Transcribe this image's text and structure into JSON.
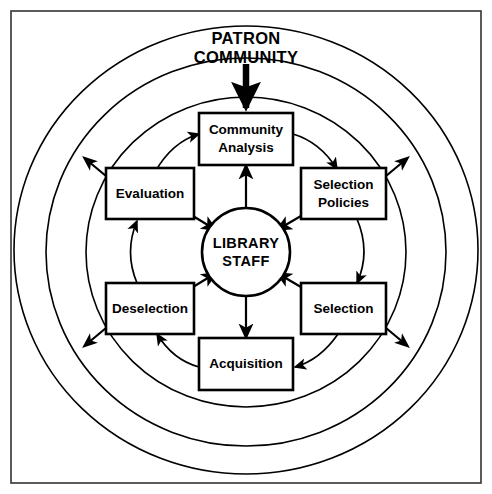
{
  "diagram": {
    "external_source": {
      "line1": "PATRON",
      "line2": "COMMUNITY"
    },
    "core": {
      "line1": "LIBRARY",
      "line2": "STAFF"
    },
    "nodes": [
      {
        "id": "community-analysis",
        "line1": "Community",
        "line2": "Analysis",
        "position": "top"
      },
      {
        "id": "selection-policies",
        "line1": "Selection",
        "line2": "Policies",
        "position": "top-right"
      },
      {
        "id": "selection",
        "line1": "Selection",
        "line2": "",
        "position": "bottom-right"
      },
      {
        "id": "acquisition",
        "line1": "Acquisition",
        "line2": "",
        "position": "bottom"
      },
      {
        "id": "deselection",
        "line1": "Deselection",
        "line2": "",
        "position": "bottom-left"
      },
      {
        "id": "evaluation",
        "line1": "Evaluation",
        "line2": "",
        "position": "top-left"
      }
    ],
    "colors": {
      "stroke": "#000000",
      "background": "#ffffff",
      "frame": "#333333"
    },
    "rings": [
      {
        "name": "outer-ring"
      },
      {
        "name": "middle-ring"
      },
      {
        "name": "inner-ring"
      }
    ]
  }
}
